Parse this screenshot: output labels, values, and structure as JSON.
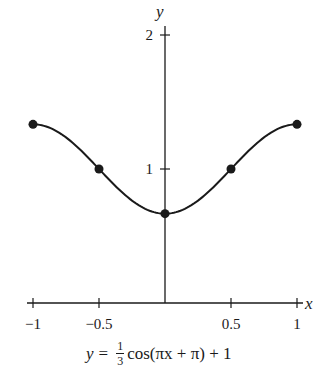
{
  "chart_data": {
    "type": "line",
    "title": "",
    "xlabel": "x",
    "ylabel": "y",
    "xlim": [
      -1,
      1
    ],
    "ylim": [
      0,
      2
    ],
    "grid": false,
    "x_ticks": [
      {
        "value": -1,
        "label": "−1"
      },
      {
        "value": -0.5,
        "label": "−0.5"
      },
      {
        "value": 0.5,
        "label": "0.5"
      },
      {
        "value": 1,
        "label": "1"
      }
    ],
    "y_ticks": [
      {
        "value": 1,
        "label": "1"
      },
      {
        "value": 2,
        "label": "2"
      }
    ],
    "series": [
      {
        "name": "y = 1/3 cos(πx + π) + 1",
        "function": "y = (1/3)cos(pi*x + pi) + 1",
        "x_range": [
          -1,
          1
        ],
        "marked_points": [
          {
            "x": -1,
            "y": 1.3333
          },
          {
            "x": -0.5,
            "y": 1
          },
          {
            "x": 0,
            "y": 0.6667
          },
          {
            "x": 0.5,
            "y": 1
          },
          {
            "x": 1,
            "y": 1.3333
          }
        ]
      }
    ],
    "caption": {
      "lhs": "y",
      "equals": "=",
      "frac_num": "1",
      "frac_den": "3",
      "rhs_text": "cos(πx + π) + 1"
    }
  },
  "labels": {
    "x_axis": "x",
    "y_axis": "y"
  },
  "style": {
    "ink": "#1a1a1a",
    "background": "#ffffff"
  }
}
